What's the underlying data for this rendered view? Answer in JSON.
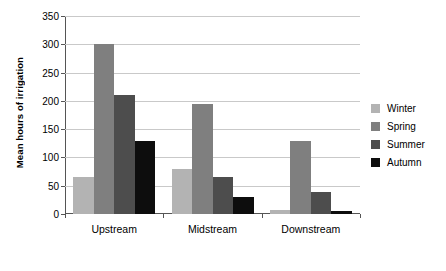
{
  "chart_data": {
    "type": "bar",
    "title": "",
    "subtitle": "",
    "xlabel": "",
    "ylabel": "Mean hours of irrigation",
    "categories": [
      "Upstream",
      "Midstream",
      "Downstream"
    ],
    "series": [
      {
        "name": "Winter",
        "color": "#b3b3b3",
        "values": [
          66,
          80,
          7
        ]
      },
      {
        "name": "Spring",
        "color": "#7f7f7f",
        "values": [
          300,
          194,
          129
        ]
      },
      {
        "name": "Summer",
        "color": "#4d4d4d",
        "values": [
          210,
          65,
          39
        ]
      },
      {
        "name": "Autumn",
        "color": "#0d0d0d",
        "values": [
          129,
          30,
          5
        ]
      }
    ],
    "ylim": [
      0,
      350
    ],
    "yticks": [
      0,
      50,
      100,
      150,
      200,
      250,
      300,
      350
    ],
    "ytick_labels": [
      "0",
      "50",
      "100",
      "150",
      "200",
      "250",
      "300",
      "350"
    ],
    "grid": true,
    "grid_axis": "y",
    "legend_position": "right",
    "legend_entries": [
      "Winter",
      "Spring",
      "Summer",
      "Autumn"
    ],
    "background_color": "#ffffff",
    "axis_color": "#555555",
    "gridline_color": "#c9c9c9"
  }
}
